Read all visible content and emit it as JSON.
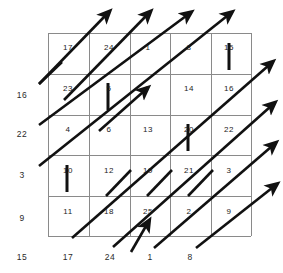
{
  "figure": {
    "type": "lattice-diagram",
    "grid": {
      "rows": 5,
      "cols": 5,
      "line_color": "#808080",
      "background": "#ffffff"
    },
    "ink_color": "#111111"
  },
  "cell_numbers": {
    "row_1": [
      "17",
      "24",
      "1",
      "8",
      "15"
    ],
    "row_2": [
      "23",
      "5",
      "7",
      "14",
      "16"
    ],
    "row_3": [
      "4",
      "6",
      "13",
      "20",
      "22"
    ],
    "row_4": [
      "10",
      "12",
      "19",
      "21",
      "3"
    ],
    "row_5": [
      "11",
      "18",
      "25",
      "2",
      "9"
    ]
  },
  "axis": {
    "left_labels": [
      "16",
      "22",
      "3",
      "9"
    ],
    "bottom_labels": [
      "15",
      "17",
      "24",
      "1",
      "8"
    ]
  },
  "markers": {
    "vertical_bars": [
      {
        "name": "bar-5-6",
        "top_label": "5",
        "bottom_label": "6"
      },
      {
        "name": "bar-15-16",
        "top_label": "15",
        "bottom_label": "16"
      },
      {
        "name": "bar-10-11",
        "top_label": "10",
        "bottom_label": "11"
      },
      {
        "name": "bar-20-21",
        "top_label": "20",
        "bottom_label": "21"
      }
    ],
    "arrow_count": 10,
    "arrow_direction": "up-right diagonal"
  }
}
